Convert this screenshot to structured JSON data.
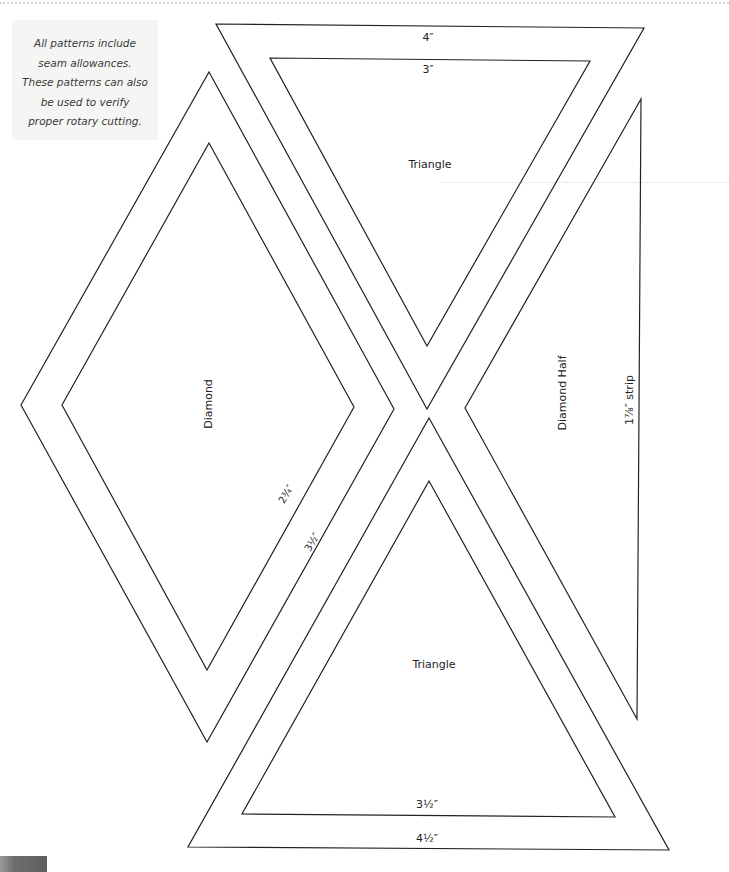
{
  "note": {
    "lines": [
      "All patterns include",
      "seam allowances.",
      "These patterns can also",
      "be used to verify",
      "proper rotary cutting."
    ]
  },
  "shapes": {
    "top_triangle": {
      "name": "Triangle",
      "outer_label": "4″",
      "inner_label": "3″",
      "outer": [
        [
          216,
          24
        ],
        [
          644,
          28
        ],
        [
          427,
          409
        ]
      ],
      "inner": [
        [
          270,
          58
        ],
        [
          590,
          61
        ],
        [
          427,
          346
        ]
      ]
    },
    "diamond": {
      "name": "Diamond",
      "inner_label": "2¾″",
      "outer_label": "3½″",
      "outer": [
        [
          209,
          72
        ],
        [
          394,
          409
        ],
        [
          207,
          742
        ],
        [
          21,
          405
        ]
      ],
      "inner": [
        [
          209,
          143
        ],
        [
          354,
          407
        ],
        [
          207,
          670
        ],
        [
          62,
          405
        ]
      ]
    },
    "diamond_half": {
      "name": "Diamond Half",
      "strip_label": "1⅞″ strip",
      "points": [
        [
          641,
          99
        ],
        [
          637,
          719
        ],
        [
          465,
          408
        ]
      ]
    },
    "bottom_triangle": {
      "name": "Triangle",
      "inner_label": "3½″",
      "outer_label": "4½″",
      "outer": [
        [
          429,
          418
        ],
        [
          669,
          850
        ],
        [
          188,
          847
        ]
      ],
      "inner": [
        [
          429,
          481
        ],
        [
          615,
          817
        ],
        [
          242,
          814
        ]
      ]
    }
  },
  "colors": {
    "line": "#222222",
    "note_bg": "#f5f5f4",
    "note_text": "#3a3a3a"
  }
}
